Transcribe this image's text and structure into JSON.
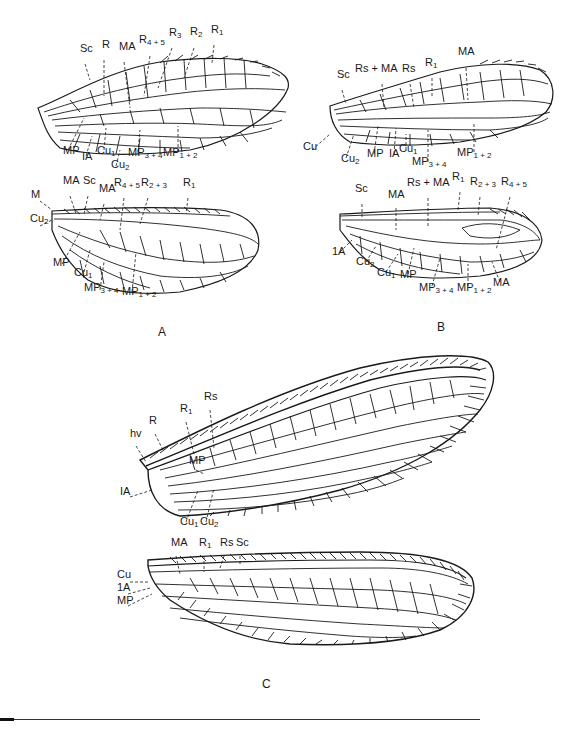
{
  "figure": {
    "panels": [
      {
        "letter": "A",
        "wings": [
          {
            "name": "forewing",
            "labels": [
              {
                "base": "Sc",
                "sub": "",
                "x": 80,
                "y": 52
              },
              {
                "base": "R",
                "sub": "",
                "x": 102,
                "y": 48
              },
              {
                "base": "MA",
                "sub": "",
                "x": 119,
                "y": 50
              },
              {
                "base": "R",
                "sub": "4 + 5",
                "x": 139,
                "y": 43
              },
              {
                "base": "R",
                "sub": "3",
                "x": 169,
                "y": 36
              },
              {
                "base": "R",
                "sub": "2",
                "x": 190,
                "y": 35
              },
              {
                "base": "R",
                "sub": "1",
                "x": 211,
                "y": 33
              },
              {
                "base": "MP",
                "sub": "",
                "x": 63,
                "y": 154
              },
              {
                "base": "IA",
                "sub": "",
                "x": 82,
                "y": 160
              },
              {
                "base": "Cu",
                "sub": "1",
                "x": 97,
                "y": 154
              },
              {
                "base": "Cu",
                "sub": "2",
                "x": 111,
                "y": 168
              },
              {
                "base": "MP",
                "sub": "3 + 4",
                "x": 128,
                "y": 156
              },
              {
                "base": "MP",
                "sub": "1 + 2",
                "x": 163,
                "y": 156
              }
            ]
          },
          {
            "name": "hindwing",
            "labels": [
              {
                "base": "M",
                "sub": "",
                "x": 31,
                "y": 198
              },
              {
                "base": "MA",
                "sub": "",
                "x": 63,
                "y": 184
              },
              {
                "base": "Sc",
                "sub": "",
                "x": 83,
                "y": 184
              },
              {
                "base": "MA",
                "sub": "",
                "x": 99,
                "y": 192
              },
              {
                "base": "R",
                "sub": "4 + 5",
                "x": 114,
                "y": 186
              },
              {
                "base": "R",
                "sub": "2 + 3",
                "x": 141,
                "y": 186
              },
              {
                "base": "R",
                "sub": "1",
                "x": 183,
                "y": 186
              },
              {
                "base": "Cu",
                "sub": "2",
                "x": 30,
                "y": 222
              },
              {
                "base": "MP",
                "sub": "",
                "x": 53,
                "y": 266
              },
              {
                "base": "Cu",
                "sub": "1",
                "x": 74,
                "y": 276
              },
              {
                "base": "MP",
                "sub": "3 + 4",
                "x": 84,
                "y": 291
              },
              {
                "base": "MP",
                "sub": "1 + 2",
                "x": 122,
                "y": 295
              }
            ]
          }
        ],
        "letter_pos": {
          "x": 158,
          "y": 332
        }
      },
      {
        "letter": "B",
        "wings": [
          {
            "name": "forewing",
            "labels": [
              {
                "base": "Sc",
                "sub": "",
                "x": 337,
                "y": 78
              },
              {
                "base": "Rs + MA",
                "sub": "",
                "x": 355,
                "y": 72
              },
              {
                "base": "Rs",
                "sub": "",
                "x": 402,
                "y": 72
              },
              {
                "base": "R",
                "sub": "1",
                "x": 425,
                "y": 66
              },
              {
                "base": "MA",
                "sub": "",
                "x": 458,
                "y": 55
              },
              {
                "base": "Cu",
                "sub": "",
                "x": 303,
                "y": 150
              },
              {
                "base": "Cu",
                "sub": "2",
                "x": 341,
                "y": 162
              },
              {
                "base": "MP",
                "sub": "",
                "x": 367,
                "y": 157
              },
              {
                "base": "IA",
                "sub": "",
                "x": 389,
                "y": 157
              },
              {
                "base": "Cu",
                "sub": "1",
                "x": 399,
                "y": 152
              },
              {
                "base": "MP",
                "sub": "3 + 4",
                "x": 412,
                "y": 165
              },
              {
                "base": "MP",
                "sub": "1 + 2",
                "x": 457,
                "y": 156
              }
            ]
          },
          {
            "name": "hindwing",
            "labels": [
              {
                "base": "Sc",
                "sub": "",
                "x": 355,
                "y": 192
              },
              {
                "base": "MA",
                "sub": "",
                "x": 388,
                "y": 198
              },
              {
                "base": "Rs + MA",
                "sub": "",
                "x": 407,
                "y": 186
              },
              {
                "base": "R",
                "sub": "1",
                "x": 452,
                "y": 180
              },
              {
                "base": "R",
                "sub": "2 + 3",
                "x": 470,
                "y": 185
              },
              {
                "base": "R",
                "sub": "4 + 5",
                "x": 501,
                "y": 185
              },
              {
                "base": "1A",
                "sub": "",
                "x": 332,
                "y": 255
              },
              {
                "base": "Cu",
                "sub": "2",
                "x": 356,
                "y": 265
              },
              {
                "base": "Cu",
                "sub": "1",
                "x": 377,
                "y": 276
              },
              {
                "base": "MP",
                "sub": "",
                "x": 400,
                "y": 278
              },
              {
                "base": "MP",
                "sub": "3 + 4",
                "x": 419,
                "y": 291
              },
              {
                "base": "MP",
                "sub": "1 + 2",
                "x": 457,
                "y": 291
              },
              {
                "base": "MA",
                "sub": "",
                "x": 493,
                "y": 286
              }
            ]
          }
        ],
        "letter_pos": {
          "x": 437,
          "y": 327
        }
      },
      {
        "letter": "C",
        "wings": [
          {
            "name": "forewing",
            "labels": [
              {
                "base": "hv",
                "sub": "",
                "x": 130,
                "y": 437
              },
              {
                "base": "R",
                "sub": "",
                "x": 149,
                "y": 424
              },
              {
                "base": "R",
                "sub": "1",
                "x": 180,
                "y": 412
              },
              {
                "base": "Rs",
                "sub": "",
                "x": 204,
                "y": 400
              },
              {
                "base": "MP",
                "sub": "",
                "x": 189,
                "y": 464
              },
              {
                "base": "IA",
                "sub": "",
                "x": 120,
                "y": 495
              },
              {
                "base": "Cu",
                "sub": "1",
                "x": 180,
                "y": 525
              },
              {
                "base": "Cu",
                "sub": "2",
                "x": 200,
                "y": 525
              }
            ]
          },
          {
            "name": "hindwing",
            "labels": [
              {
                "base": "MA",
                "sub": "",
                "x": 171,
                "y": 546
              },
              {
                "base": "R",
                "sub": "1",
                "x": 199,
                "y": 546
              },
              {
                "base": "Rs",
                "sub": "",
                "x": 220,
                "y": 546
              },
              {
                "base": "Sc",
                "sub": "",
                "x": 236,
                "y": 546
              },
              {
                "base": "Cu",
                "sub": "",
                "x": 117,
                "y": 578
              },
              {
                "base": "1A",
                "sub": "",
                "x": 117,
                "y": 591
              },
              {
                "base": "MP",
                "sub": "",
                "x": 117,
                "y": 604
              }
            ]
          }
        ],
        "letter_pos": {
          "x": 262,
          "y": 682
        }
      }
    ]
  }
}
